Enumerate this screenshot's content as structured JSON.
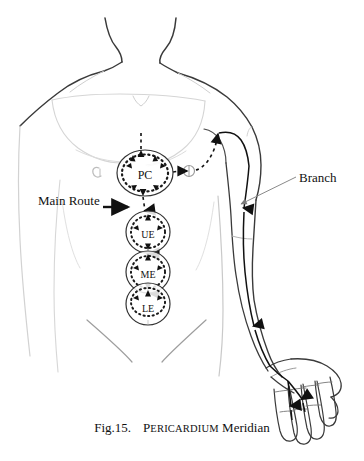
{
  "figure": {
    "caption": {
      "figure_number": "Fig.15.",
      "meridian_name_lead": "P",
      "meridian_name_rest": "ERICARDIUM",
      "meridian_name_full": "PERICARDIUM",
      "suffix": "Meridian"
    },
    "annotations": [
      {
        "id": "main-route",
        "label": "Main Route"
      },
      {
        "id": "branch",
        "label": "Branch"
      }
    ],
    "acupoint_circles": [
      {
        "id": "pc",
        "label": "PC",
        "cx": 145,
        "cy": 173,
        "rx": 28,
        "ry": 23
      },
      {
        "id": "ue",
        "label": "UE",
        "cx": 148,
        "cy": 232,
        "rx": 22,
        "ry": 21
      },
      {
        "id": "me",
        "label": "ME",
        "cx": 148,
        "cy": 272,
        "rx": 22,
        "ry": 21
      },
      {
        "id": "le",
        "label": "LE",
        "cx": 148,
        "cy": 304,
        "rx": 22,
        "ry": 21
      }
    ],
    "colors": {
      "background": "#ffffff",
      "body_outline_dark": "#3a3a3a",
      "body_outline_light": "#c9c9c9",
      "meridian": "#1a1a1a",
      "leader_line": "#7a7a7a",
      "text": "#111111"
    }
  }
}
